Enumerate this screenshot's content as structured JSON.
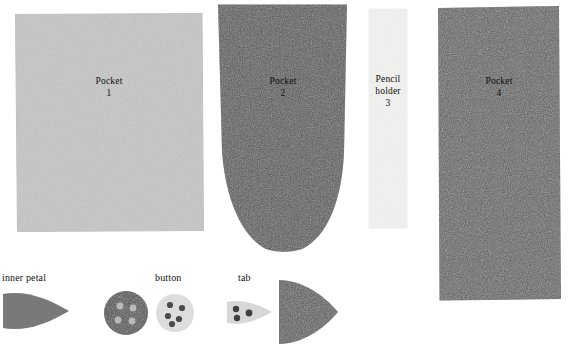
{
  "document": {
    "kind": "sewing-pattern-piece-layout",
    "background_color": "#ffffff"
  },
  "pieces": [
    {
      "id": "pocket-1",
      "label": "Pocket",
      "number": "1",
      "shape": "rectangle",
      "fabric_color": "#cccccc",
      "label_color": "#111111"
    },
    {
      "id": "pocket-2",
      "label": "Pocket",
      "number": "2",
      "shape": "round-bottom-rectangle",
      "fabric_color": "#555555",
      "label_color": "#0d0d0d"
    },
    {
      "id": "pencil-holder-3",
      "label": "Pencil\nholder",
      "number": "3",
      "shape": "narrow-strip",
      "fabric_color": "#f2f2f0",
      "label_color": "#111111"
    },
    {
      "id": "pocket-4",
      "label": "Pocket",
      "number": "4",
      "shape": "rectangle",
      "fabric_color": "#5e5e5e",
      "label_color": "#0d0d0d"
    }
  ],
  "small_pieces": [
    {
      "id": "inner-petal",
      "caption": "inner petal",
      "shape": "petal",
      "fabric_color": "#5a5a5a",
      "holes": 0
    },
    {
      "id": "button-dark",
      "caption": "button",
      "shape": "circle",
      "fabric_color": "#4a4a4a",
      "hole_color": "#b9b9b9",
      "holes": 4
    },
    {
      "id": "button-light",
      "caption": "button",
      "shape": "circle",
      "fabric_color": "#e2e2e0",
      "hole_color": "#4a4a4a",
      "holes": 5
    },
    {
      "id": "tab",
      "caption": "tab",
      "shape": "petal",
      "fabric_color": "#dcdcda",
      "hole_color": "#3f3f3f",
      "holes": 3
    },
    {
      "id": "outer-petal",
      "caption": "",
      "shape": "petal",
      "fabric_color": "#575757",
      "holes": 0
    }
  ],
  "captions": {
    "inner_petal": "inner petal",
    "button": "button",
    "tab": "tab"
  },
  "colors": {
    "light_fabric": "#cccccc",
    "dark_fabric": "#555555",
    "white_fabric": "#f2f2f0",
    "medium_fabric": "#5e5e5e",
    "text": "#111111",
    "page_background": "#ffffff"
  }
}
